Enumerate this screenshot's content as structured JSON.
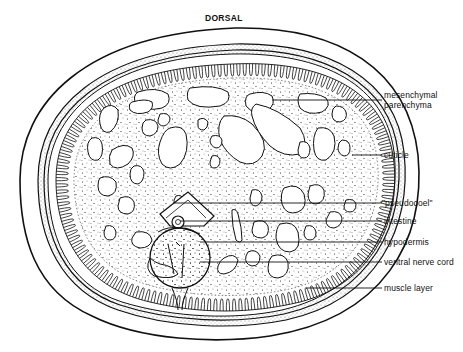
{
  "figure": {
    "title": "DORSAL",
    "labels": [
      {
        "id": "mesenchymal",
        "line1": "mesenchymal",
        "line2": "parenchyma"
      },
      {
        "id": "cuticle",
        "line1": "cuticle"
      },
      {
        "id": "pseudocoel",
        "line1": "\"pseudocoel\""
      },
      {
        "id": "intestine",
        "line1": "intestine"
      },
      {
        "id": "hypodermis",
        "line1": "hypodermis"
      },
      {
        "id": "ventral-nerve-cord",
        "line1": "ventral nerve cord"
      },
      {
        "id": "muscle-layer",
        "line1": "muscle layer"
      }
    ]
  }
}
